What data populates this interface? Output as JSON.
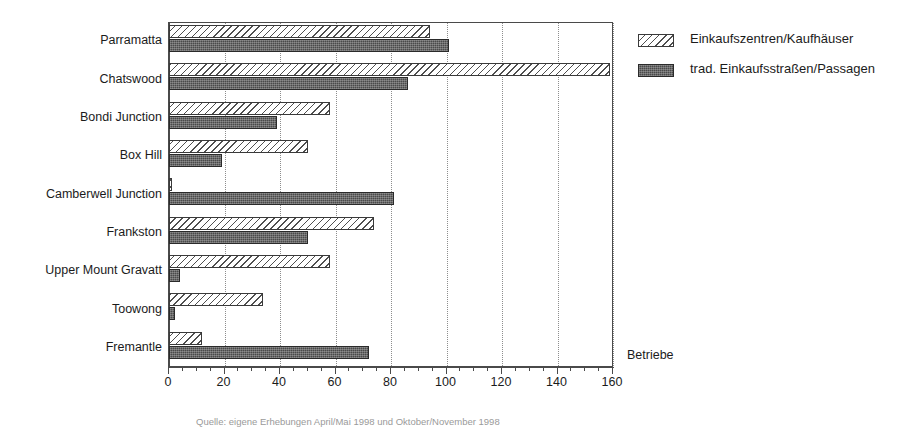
{
  "chart_data": {
    "type": "bar",
    "orientation": "horizontal",
    "title": "",
    "xlabel": "Betriebe",
    "ylabel": "",
    "xlim": [
      0,
      160
    ],
    "xticks": [
      0,
      20,
      40,
      60,
      80,
      100,
      120,
      140,
      160
    ],
    "xtick_labels": [
      "0",
      "20",
      "40",
      "60",
      "80",
      "100",
      "120",
      "140",
      "160"
    ],
    "minor_tick_step": 5,
    "grid": "vertical-dotted",
    "legend_position": "right",
    "categories": [
      "Parramatta",
      "Chatswood",
      "Bondi Junction",
      "Box Hill",
      "Camberwell Junction",
      "Frankston",
      "Upper Mount Gravatt",
      "Toowong",
      "Fremantle"
    ],
    "series": [
      {
        "name": "Einkaufszentren/Kaufhäuser",
        "pattern": "diagonal-hatch",
        "color": "#f2f2f2",
        "values": [
          94,
          159,
          58,
          50,
          1,
          74,
          58,
          34,
          12
        ]
      },
      {
        "name": "trad. Einkaufsstraßen/Passagen",
        "pattern": "dark-stipple",
        "color": "#4a4a4a",
        "values": [
          101,
          86,
          39,
          19,
          81,
          50,
          4,
          2,
          72
        ]
      }
    ],
    "source_note": "Quelle: eigene Erhebungen April/Mai 1998 und Oktober/November 1998"
  },
  "legend": {
    "items": [
      {
        "label": "Einkaufszentren/Kaufhäuser",
        "pattern": "diagonal-hatch"
      },
      {
        "label": "trad. Einkaufsstraßen/Passagen",
        "pattern": "dark-stipple"
      }
    ]
  },
  "axis": {
    "x_title": "Betriebe"
  }
}
